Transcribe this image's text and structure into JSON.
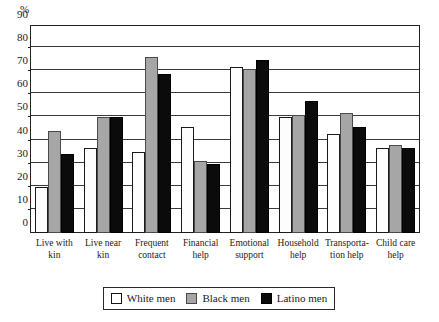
{
  "chart_data": {
    "type": "bar",
    "title": "",
    "xlabel": "",
    "ylabel": "%",
    "ylim": [
      0,
      90
    ],
    "ytick_step": 10,
    "yticks": [
      90,
      80,
      70,
      60,
      50,
      40,
      30,
      20,
      10,
      0
    ],
    "grid": true,
    "legend_position": "bottom",
    "categories": [
      "Live with kin",
      "Live near kin",
      "Frequent contact",
      "Financial help",
      "Emotional support",
      "Household help",
      "Transportation help",
      "Child care help"
    ],
    "category_lines": [
      [
        "Live with",
        "kin"
      ],
      [
        "Live near",
        "kin"
      ],
      [
        "Frequent",
        "contact"
      ],
      [
        "Financial",
        "help"
      ],
      [
        "Emotional",
        "support"
      ],
      [
        "Household",
        "help"
      ],
      [
        "Transporta-",
        "tion help"
      ],
      [
        "Child care",
        "help"
      ]
    ],
    "series": [
      {
        "name": "White men",
        "color": "#ffffff",
        "values": [
          20,
          37,
          35,
          46,
          72,
          50,
          43,
          37
        ]
      },
      {
        "name": "Black men",
        "color": "#a6a6a6",
        "values": [
          44,
          50,
          76,
          31,
          71,
          51,
          52,
          38
        ]
      },
      {
        "name": "Latino men",
        "color": "#0b0b0b",
        "values": [
          34,
          50,
          69,
          30,
          75,
          57,
          46,
          37
        ]
      }
    ]
  },
  "legend": {
    "items": [
      {
        "label": "White men",
        "swatch": "white"
      },
      {
        "label": "Black men",
        "swatch": "gray"
      },
      {
        "label": "Latino men",
        "swatch": "black"
      }
    ]
  }
}
